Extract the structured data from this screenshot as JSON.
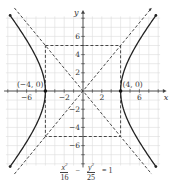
{
  "diagram": {
    "type": "hyperbola-graph",
    "equation": {
      "term1": {
        "numerator_var": "x",
        "numerator_exp": "2",
        "denominator": "16"
      },
      "operator": "−",
      "term2": {
        "numerator_var": "y",
        "numerator_exp": "2",
        "denominator": "25"
      },
      "equals": "= 1"
    },
    "axes": {
      "x_label": "x",
      "y_label": "y",
      "x_ticks": [
        "−6",
        "−2",
        "2",
        "6"
      ],
      "y_ticks": [
        "6",
        "4",
        "2",
        "−2",
        "−4",
        "−6"
      ]
    },
    "vertices": [
      {
        "label": "(−4, 0)",
        "x": -4,
        "y": 0
      },
      {
        "label": "(4, 0)",
        "x": 4,
        "y": 0
      }
    ],
    "a": 4,
    "b": 5,
    "asymptotes": [
      "y = 5x/4",
      "y = −5x/4"
    ],
    "fundamental_rectangle": {
      "x_min": -4,
      "x_max": 4,
      "y_min": -5,
      "y_max": 5
    },
    "colors": {
      "curve": "#222222",
      "dashed": "#333333",
      "grid": "#dcdcdc",
      "axis": "#444444"
    }
  }
}
